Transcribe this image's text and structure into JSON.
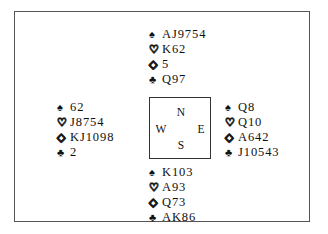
{
  "diagram": {
    "kind": "bridge-hand-diagram",
    "border_color": "#555555",
    "background_color": "#ffffff",
    "text_color": "#111111"
  },
  "suits": {
    "spade": {
      "glyph": "♠",
      "name": "spade-suit-symbol",
      "filled": true
    },
    "heart": {
      "glyph": "♡",
      "name": "heart-suit-symbol",
      "filled": false
    },
    "diamond": {
      "glyph": "◇",
      "name": "diamond-suit-symbol",
      "filled": false
    },
    "club": {
      "glyph": "♣",
      "name": "club-suit-symbol",
      "filled": true
    }
  },
  "compass": {
    "north": "N",
    "south": "S",
    "west": "W",
    "east": "E"
  },
  "hands": {
    "north": {
      "position": "North",
      "spades": "AJ9754",
      "hearts": "K62",
      "diamonds": "5",
      "clubs": "Q97"
    },
    "west": {
      "position": "West",
      "spades": "62",
      "hearts": "J8754",
      "diamonds": "KJ1098",
      "clubs": "2"
    },
    "east": {
      "position": "East",
      "spades": "Q8",
      "hearts": "Q10",
      "diamonds": "A642",
      "clubs": "J10543"
    },
    "south": {
      "position": "South",
      "spades": "K103",
      "hearts": "A93",
      "diamonds": "Q73",
      "clubs": "AK86"
    }
  }
}
